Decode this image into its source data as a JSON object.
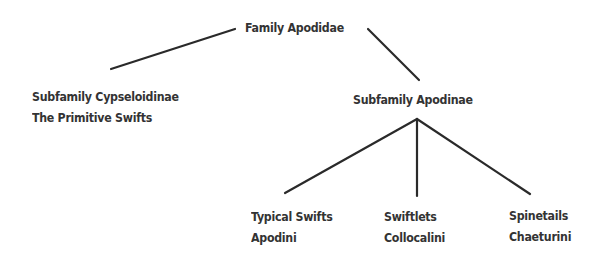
{
  "diagram": {
    "type": "tree",
    "title": "Family Apodidae",
    "line_color": "#2a2a2a",
    "text_color": "#333333",
    "nodes": {
      "root": {
        "lines": [
          "Family Apodidae"
        ]
      },
      "cypseloidinae": {
        "lines": [
          "Subfamily Cypseloidinae",
          "The Primitive Swifts"
        ]
      },
      "apodinae": {
        "lines": [
          "Subfamily Apodinae"
        ]
      },
      "apodini": {
        "lines": [
          "Typical Swifts",
          "Apodini"
        ]
      },
      "collocalini": {
        "lines": [
          "Swiftlets",
          "Collocalini"
        ]
      },
      "chaeturini": {
        "lines": [
          "Spinetails",
          "Chaeturini"
        ]
      }
    },
    "edges": [
      {
        "from": "root",
        "to": "cypseloidinae"
      },
      {
        "from": "root",
        "to": "apodinae"
      },
      {
        "from": "apodinae",
        "to": "apodini"
      },
      {
        "from": "apodinae",
        "to": "collocalini"
      },
      {
        "from": "apodinae",
        "to": "chaeturini"
      }
    ]
  }
}
